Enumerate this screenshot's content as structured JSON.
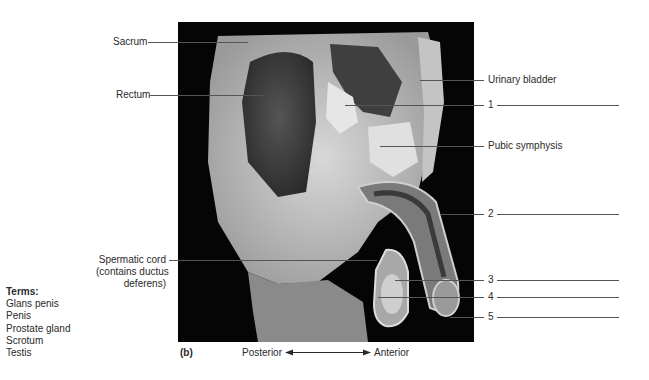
{
  "figure": {
    "panel_letter": "(b)",
    "orientation": {
      "left": "Posterior",
      "right": "Anterior"
    },
    "labels_left": {
      "sacrum": "Sacrum",
      "rectum": "Rectum",
      "spermatic_cord": [
        "Spermatic cord",
        "(contains ductus",
        "deferens)"
      ]
    },
    "labels_right": {
      "urinary_bladder": "Urinary bladder",
      "pubic_symphysis": "Pubic symphysis"
    },
    "numbered_blanks": [
      "1",
      "2",
      "3",
      "4",
      "5"
    ],
    "terms": {
      "heading": "Terms:",
      "items": [
        "Glans penis",
        "Penis",
        "Prostate gland",
        "Scrotum",
        "Testis"
      ]
    }
  }
}
